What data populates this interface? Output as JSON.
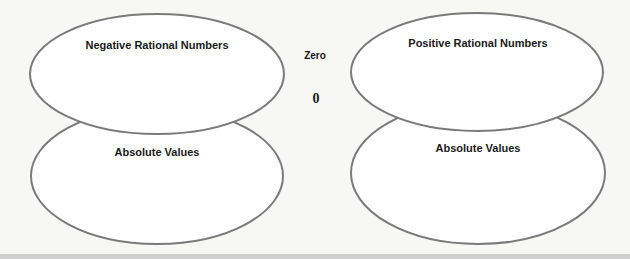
{
  "diagram": {
    "left": {
      "top_label": "Negative Rational Numbers",
      "bottom_label": "Absolute Values"
    },
    "center": {
      "label": "Zero",
      "value": "0"
    },
    "right": {
      "top_label": "Positive Rational Numbers",
      "bottom_label": "Absolute Values"
    },
    "colors": {
      "stroke": "#7a7a7a",
      "fill": "#ffffff",
      "background": "#f7f7f5"
    }
  }
}
